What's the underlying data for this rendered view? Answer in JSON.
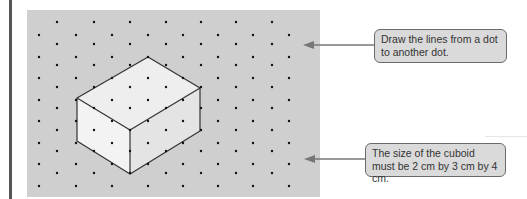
{
  "figure": {
    "colors": {
      "panel_background": "#cfcfcf",
      "dot": "#111111",
      "edge": "#333333",
      "top_face": "#eeeeee",
      "left_face": "#f3f3f3",
      "right_face": "#e4e4e4",
      "callout_background": "#dadada",
      "callout_border": "#6a6a6a",
      "arrow": "#777777"
    },
    "dot_grid": {
      "type": "isometric",
      "column_spacing_px": 18,
      "row_spacing_px": 21.5
    },
    "cuboid": {
      "dimensions_cm": [
        2,
        3,
        4
      ],
      "vertices": {
        "top_back": [
          148,
          57
        ],
        "top_left": [
          77,
          98
        ],
        "top_front": [
          130,
          130
        ],
        "top_right": [
          200,
          88
        ],
        "bottom_left": [
          77,
          141
        ],
        "bottom_front": [
          130,
          174
        ],
        "bottom_right": [
          200,
          131
        ]
      }
    }
  },
  "callouts": [
    {
      "id": "draw-lines",
      "text": "Draw the lines from a dot to another dot."
    },
    {
      "id": "cuboid-size",
      "text": "The size of the cuboid must be 2 cm by 3 cm by 4 cm."
    }
  ]
}
